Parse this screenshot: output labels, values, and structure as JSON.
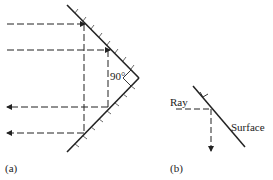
{
  "diagram": {
    "panel_a": {
      "label": "(a)",
      "angle_label": "90°",
      "description": "Corner reflector: two perpendicular mirrors; incoming horizontal rays reflected back antiparallel"
    },
    "panel_b": {
      "label": "(b)",
      "ray_label": "Ray",
      "surface_label": "Surface",
      "description": "Single inclined surface reflecting horizontal ray downward"
    },
    "colors": {
      "line": "#222222",
      "background": "#ffffff"
    }
  }
}
